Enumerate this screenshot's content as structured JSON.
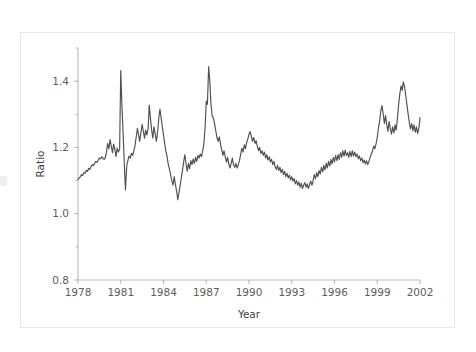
{
  "figure": {
    "background_color": "#ffffff",
    "frame_color": "#e8e8e8",
    "line_color": "#4f4f4f",
    "axis_color": "#b9b9b9",
    "text_color": "#5d5d5d"
  },
  "chart_data": {
    "type": "line",
    "title": "",
    "subtitle": "",
    "xlabel": "Year",
    "ylabel": "Ratio",
    "xlim": [
      1978,
      2002
    ],
    "ylim": [
      0.8,
      1.5
    ],
    "xticks": [
      1978,
      1981,
      1984,
      1987,
      1990,
      1993,
      1996,
      1999,
      2002
    ],
    "xticklabels": [
      "1978",
      "1981",
      "1984",
      "1987",
      "1990",
      "1993",
      "1996",
      "1999",
      "2002"
    ],
    "yticks": [
      0.8,
      1.0,
      1.2,
      1.4
    ],
    "yticklabels": [
      "0.8",
      "1.0",
      "1.2",
      "1.4"
    ],
    "grid": false,
    "legend": null,
    "annotations": [],
    "series": [
      {
        "name": "Ratio",
        "color": "#4f4f4f",
        "x": [
          1978.0,
          1978.08,
          1978.17,
          1978.25,
          1978.33,
          1978.42,
          1978.5,
          1978.58,
          1978.67,
          1978.75,
          1978.83,
          1978.92,
          1979.0,
          1979.08,
          1979.17,
          1979.25,
          1979.33,
          1979.42,
          1979.5,
          1979.58,
          1979.67,
          1979.75,
          1979.83,
          1979.92,
          1980.0,
          1980.08,
          1980.17,
          1980.25,
          1980.33,
          1980.42,
          1980.5,
          1980.58,
          1980.67,
          1980.75,
          1980.83,
          1980.92,
          1981.0,
          1981.08,
          1981.17,
          1981.25,
          1981.33,
          1981.42,
          1981.5,
          1981.58,
          1981.67,
          1981.75,
          1981.83,
          1981.92,
          1982.0,
          1982.08,
          1982.17,
          1982.25,
          1982.33,
          1982.42,
          1982.5,
          1982.58,
          1982.67,
          1982.75,
          1982.83,
          1982.92,
          1983.0,
          1983.08,
          1983.17,
          1983.25,
          1983.33,
          1983.42,
          1983.5,
          1983.58,
          1983.67,
          1983.75,
          1983.83,
          1983.92,
          1984.0,
          1984.08,
          1984.17,
          1984.25,
          1984.33,
          1984.42,
          1984.5,
          1984.58,
          1984.67,
          1984.75,
          1984.83,
          1984.92,
          1985.0,
          1985.08,
          1985.17,
          1985.25,
          1985.33,
          1985.42,
          1985.5,
          1985.58,
          1985.67,
          1985.75,
          1985.83,
          1985.92,
          1986.0,
          1986.08,
          1986.17,
          1986.25,
          1986.33,
          1986.42,
          1986.5,
          1986.58,
          1986.67,
          1986.75,
          1986.83,
          1986.92,
          1987.0,
          1987.08,
          1987.17,
          1987.25,
          1987.33,
          1987.42,
          1987.5,
          1987.58,
          1987.67,
          1987.75,
          1987.83,
          1987.92,
          1988.0,
          1988.08,
          1988.17,
          1988.25,
          1988.33,
          1988.42,
          1988.5,
          1988.58,
          1988.67,
          1988.75,
          1988.83,
          1988.92,
          1989.0,
          1989.08,
          1989.17,
          1989.25,
          1989.33,
          1989.42,
          1989.5,
          1989.58,
          1989.67,
          1989.75,
          1989.83,
          1989.92,
          1990.0,
          1990.08,
          1990.17,
          1990.25,
          1990.33,
          1990.42,
          1990.5,
          1990.58,
          1990.67,
          1990.75,
          1990.83,
          1990.92,
          1991.0,
          1991.08,
          1991.17,
          1991.25,
          1991.33,
          1991.42,
          1991.5,
          1991.58,
          1991.67,
          1991.75,
          1991.83,
          1991.92,
          1992.0,
          1992.08,
          1992.17,
          1992.25,
          1992.33,
          1992.42,
          1992.5,
          1992.58,
          1992.67,
          1992.75,
          1992.83,
          1992.92,
          1993.0,
          1993.08,
          1993.17,
          1993.25,
          1993.33,
          1993.42,
          1993.5,
          1993.58,
          1993.67,
          1993.75,
          1993.83,
          1993.92,
          1994.0,
          1994.08,
          1994.17,
          1994.25,
          1994.33,
          1994.42,
          1994.5,
          1994.58,
          1994.67,
          1994.75,
          1994.83,
          1994.92,
          1995.0,
          1995.08,
          1995.17,
          1995.25,
          1995.33,
          1995.42,
          1995.5,
          1995.58,
          1995.67,
          1995.75,
          1995.83,
          1995.92,
          1996.0,
          1996.08,
          1996.17,
          1996.25,
          1996.33,
          1996.42,
          1996.5,
          1996.58,
          1996.67,
          1996.75,
          1996.83,
          1996.92,
          1997.0,
          1997.08,
          1997.17,
          1997.25,
          1997.33,
          1997.42,
          1997.5,
          1997.58,
          1997.67,
          1997.75,
          1997.83,
          1997.92,
          1998.0,
          1998.08,
          1998.17,
          1998.25,
          1998.33,
          1998.42,
          1998.5,
          1998.58,
          1998.67,
          1998.75,
          1998.83,
          1998.92,
          1999.0,
          1999.08,
          1999.17,
          1999.25,
          1999.33,
          1999.42,
          1999.5,
          1999.58,
          1999.67,
          1999.75,
          1999.83,
          1999.92,
          2000.0,
          2000.08,
          2000.17,
          2000.25,
          2000.33,
          2000.42,
          2000.5,
          2000.58,
          2000.67,
          2000.75,
          2000.83,
          2000.92,
          2001.0,
          2001.08,
          2001.17,
          2001.25,
          2001.33,
          2001.42,
          2001.5,
          2001.58,
          2001.67,
          2001.75,
          2001.83,
          2001.92,
          2002.0
        ],
        "y": [
          1.103,
          1.108,
          1.112,
          1.118,
          1.115,
          1.124,
          1.122,
          1.131,
          1.128,
          1.137,
          1.134,
          1.142,
          1.148,
          1.145,
          1.152,
          1.158,
          1.155,
          1.162,
          1.168,
          1.166,
          1.172,
          1.168,
          1.164,
          1.17,
          1.186,
          1.212,
          1.196,
          1.224,
          1.204,
          1.184,
          1.21,
          1.196,
          1.172,
          1.198,
          1.186,
          1.194,
          1.432,
          1.33,
          1.24,
          1.15,
          1.072,
          1.145,
          1.16,
          1.174,
          1.168,
          1.182,
          1.176,
          1.19,
          1.205,
          1.23,
          1.258,
          1.238,
          1.218,
          1.246,
          1.27,
          1.25,
          1.228,
          1.252,
          1.238,
          1.256,
          1.328,
          1.29,
          1.252,
          1.228,
          1.262,
          1.24,
          1.218,
          1.244,
          1.288,
          1.316,
          1.29,
          1.262,
          1.238,
          1.212,
          1.188,
          1.172,
          1.15,
          1.134,
          1.118,
          1.1,
          1.086,
          1.112,
          1.09,
          1.068,
          1.042,
          1.062,
          1.086,
          1.108,
          1.13,
          1.158,
          1.178,
          1.15,
          1.128,
          1.152,
          1.136,
          1.16,
          1.148,
          1.165,
          1.152,
          1.17,
          1.158,
          1.176,
          1.168,
          1.18,
          1.172,
          1.19,
          1.21,
          1.26,
          1.34,
          1.33,
          1.444,
          1.4,
          1.33,
          1.294,
          1.29,
          1.272,
          1.25,
          1.23,
          1.218,
          1.232,
          1.21,
          1.194,
          1.176,
          1.19,
          1.172,
          1.156,
          1.17,
          1.15,
          1.138,
          1.152,
          1.168,
          1.146,
          1.14,
          1.152,
          1.138,
          1.148,
          1.16,
          1.18,
          1.198,
          1.186,
          1.208,
          1.196,
          1.214,
          1.226,
          1.24,
          1.248,
          1.232,
          1.218,
          1.23,
          1.212,
          1.22,
          1.204,
          1.19,
          1.2,
          1.182,
          1.19,
          1.176,
          1.186,
          1.168,
          1.178,
          1.162,
          1.172,
          1.156,
          1.164,
          1.148,
          1.158,
          1.142,
          1.134,
          1.146,
          1.13,
          1.14,
          1.124,
          1.134,
          1.118,
          1.128,
          1.112,
          1.122,
          1.108,
          1.116,
          1.102,
          1.112,
          1.098,
          1.106,
          1.09,
          1.1,
          1.086,
          1.096,
          1.08,
          1.092,
          1.076,
          1.086,
          1.094,
          1.08,
          1.09,
          1.076,
          1.088,
          1.098,
          1.086,
          1.1,
          1.118,
          1.106,
          1.124,
          1.112,
          1.13,
          1.12,
          1.14,
          1.126,
          1.146,
          1.132,
          1.152,
          1.138,
          1.158,
          1.144,
          1.164,
          1.15,
          1.17,
          1.156,
          1.176,
          1.16,
          1.178,
          1.164,
          1.184,
          1.17,
          1.19,
          1.174,
          1.192,
          1.176,
          1.184,
          1.17,
          1.188,
          1.172,
          1.19,
          1.174,
          1.186,
          1.172,
          1.18,
          1.166,
          1.174,
          1.16,
          1.168,
          1.154,
          1.162,
          1.15,
          1.16,
          1.148,
          1.158,
          1.17,
          1.18,
          1.19,
          1.204,
          1.196,
          1.212,
          1.23,
          1.258,
          1.28,
          1.31,
          1.326,
          1.3,
          1.272,
          1.296,
          1.268,
          1.248,
          1.278,
          1.256,
          1.24,
          1.262,
          1.244,
          1.268,
          1.252,
          1.29,
          1.33,
          1.36,
          1.386,
          1.372,
          1.398,
          1.382,
          1.356,
          1.33,
          1.3,
          1.276,
          1.256,
          1.272,
          1.25,
          1.268,
          1.246,
          1.262,
          1.242,
          1.258,
          1.29
        ]
      }
    ]
  }
}
